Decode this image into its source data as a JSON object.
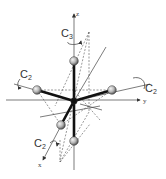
{
  "diagram": {
    "type": "molecular-symmetry",
    "axes": {
      "x": "x",
      "y": "y",
      "z": "z"
    },
    "symmetry_elements": {
      "c3_axis": {
        "label": "C",
        "subscript": "3"
      },
      "c2_left": {
        "label": "C",
        "subscript": "2"
      },
      "c2_right": {
        "label": "C",
        "subscript": "2"
      },
      "c2_front": {
        "label": "C",
        "subscript": "2"
      }
    },
    "atoms": {
      "central": "central-atom",
      "ligands": [
        "axial-top",
        "axial-bottom",
        "equatorial-left",
        "equatorial-right",
        "equatorial-front"
      ]
    },
    "colors": {
      "bond": "#111111",
      "atom_fill": "#bdbdbd",
      "line": "#444444",
      "dashed": "#555555"
    }
  }
}
